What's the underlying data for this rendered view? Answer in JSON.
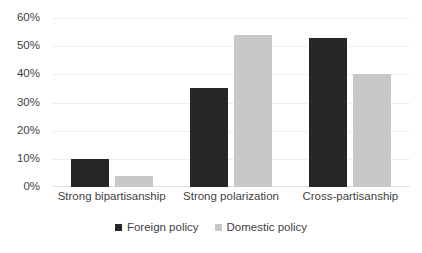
{
  "chart_data": {
    "type": "bar",
    "title": "",
    "subtitle": "",
    "xlabel": "",
    "ylabel": "",
    "categories": [
      "Strong bipartisanship",
      "Strong polarization",
      "Cross-partisanship"
    ],
    "series": [
      {
        "name": "Foreign policy",
        "color": "#262626",
        "values": [
          10,
          35,
          53
        ]
      },
      {
        "name": "Domestic policy",
        "color": "#c8c8c8",
        "values": [
          4,
          54,
          40
        ]
      }
    ],
    "ylim": [
      0,
      60
    ],
    "ytick_values": [
      60,
      50,
      40,
      30,
      20,
      10,
      0
    ],
    "ytick_labels": [
      "60%",
      "50%",
      "40%",
      "30%",
      "20%",
      "10%",
      "0%"
    ],
    "grid": true,
    "grid_axis": "y",
    "legend_position": "bottom",
    "value_format": "percent",
    "orientation": "vertical",
    "grouping": "grouped"
  },
  "colors": {
    "foreign_policy": "#262626",
    "domestic_policy": "#c8c8c8",
    "gridline": "#efefef",
    "baseline": "#e2e2e2",
    "text": "#3f3f3f",
    "background": "#ffffff"
  },
  "caption": {
    "text": ""
  }
}
